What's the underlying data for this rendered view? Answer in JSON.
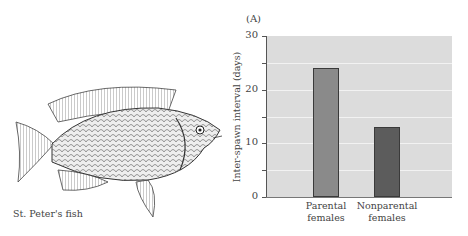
{
  "figure": {
    "panel_label": "(A)",
    "caption": "St. Peter's fish"
  },
  "chart_data": {
    "type": "bar",
    "title": "",
    "xlabel": "",
    "ylabel": "Inter-spawn interval (days)",
    "ylim": [
      0,
      30
    ],
    "yticks": [
      0,
      10,
      20,
      30
    ],
    "grid": true,
    "categories": [
      "Parental females",
      "Nonparental females"
    ],
    "category_lines": [
      [
        "Parental",
        "females"
      ],
      [
        "Nonparental",
        "females"
      ]
    ],
    "values": [
      24,
      13
    ],
    "colors": [
      "#8a8a8a",
      "#5c5c5c"
    ]
  }
}
